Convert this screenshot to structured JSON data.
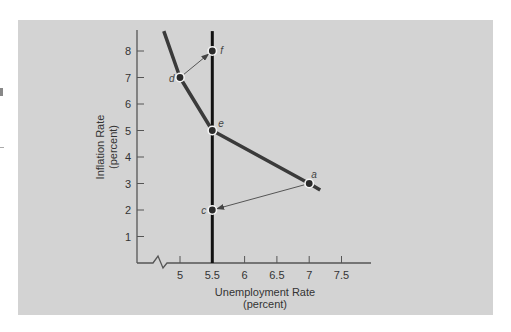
{
  "chart_data": {
    "type": "line",
    "title": "",
    "xlabel": "Unemployment Rate",
    "xlabel_sub": "(percent)",
    "ylabel": "Inflation Rate",
    "ylabel_sub": "(percent)",
    "x_ticks": [
      "5",
      "5.5",
      "6",
      "6.5",
      "7",
      "7.5"
    ],
    "y_ticks": [
      "1",
      "2",
      "3",
      "4",
      "5",
      "6",
      "7",
      "8"
    ],
    "xlim": [
      4.5,
      8.0
    ],
    "ylim": [
      0,
      8.8
    ],
    "x_axis_break": true,
    "grid": false,
    "series": [
      {
        "name": "Short-run Phillips curve",
        "style": "thick-dark",
        "points": [
          {
            "x": 4.75,
            "y": 8.75
          },
          {
            "x": 5.0,
            "y": 7.0
          },
          {
            "x": 5.5,
            "y": 5.0
          },
          {
            "x": 7.0,
            "y": 3.0
          },
          {
            "x": 7.17,
            "y": 2.75
          }
        ]
      },
      {
        "name": "Vertical long-run Phillips curve",
        "style": "thick-black",
        "points": [
          {
            "x": 5.5,
            "y": 0
          },
          {
            "x": 5.5,
            "y": 8.75
          }
        ]
      }
    ],
    "labeled_points": [
      {
        "label": "a",
        "x": 7.0,
        "y": 3.0
      },
      {
        "label": "c",
        "x": 5.5,
        "y": 2.0
      },
      {
        "label": "d",
        "x": 5.0,
        "y": 7.0
      },
      {
        "label": "e",
        "x": 5.5,
        "y": 5.0
      },
      {
        "label": "f",
        "x": 5.5,
        "y": 8.0
      }
    ],
    "arrows": [
      {
        "from": "a",
        "to": "c"
      },
      {
        "from": "d",
        "to": "f"
      }
    ],
    "colors": {
      "panel": "#d3d3d3",
      "curve": "#3a3a3a",
      "vertical": "#111111",
      "arrow": "#555555",
      "text": "#333333"
    }
  }
}
